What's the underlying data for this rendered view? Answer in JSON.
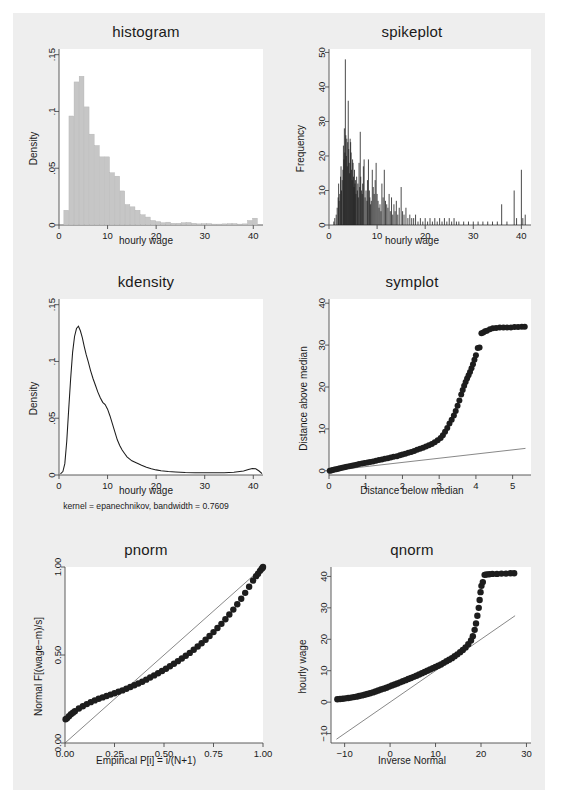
{
  "page": {
    "background": "#eeeeee",
    "outer_background": "#ffffff",
    "layout": "2 columns x 3 rows of Stata distribution diagnostic plots"
  },
  "panels": [
    {
      "id": "histogram",
      "title": "histogram"
    },
    {
      "id": "spikeplot",
      "title": "spikeplot"
    },
    {
      "id": "kdensity",
      "title": "kdensity"
    },
    {
      "id": "symplot",
      "title": "symplot"
    },
    {
      "id": "pnorm",
      "title": "pnorm"
    },
    {
      "id": "qnorm",
      "title": "qnorm"
    }
  ],
  "chart_data": [
    {
      "type": "bar",
      "id": "histogram",
      "title": "histogram",
      "xlabel": "hourly wage",
      "ylabel": "Density",
      "xlim": [
        0,
        42
      ],
      "ylim": [
        0,
        0.155
      ],
      "xticks": [
        0,
        10,
        20,
        30,
        40
      ],
      "xticklabels": [
        "0",
        "10",
        "20",
        "30",
        "40"
      ],
      "yticks": [
        0,
        0.05,
        0.1,
        0.15
      ],
      "yticklabels": [
        "0",
        ".05",
        ".1",
        ".15"
      ],
      "grid": false,
      "bin_width": 1.05,
      "bin_starts": [
        1.0,
        2.05,
        3.1,
        4.15,
        5.2,
        6.25,
        7.3,
        8.35,
        9.4,
        10.45,
        11.5,
        12.55,
        13.6,
        14.65,
        15.7,
        16.75,
        17.8,
        18.85,
        19.9,
        20.95,
        22.0,
        23.05,
        24.1,
        25.15,
        26.2,
        27.25,
        28.3,
        29.35,
        30.4,
        31.45,
        32.5,
        33.55,
        34.6,
        35.65,
        36.7,
        37.75,
        38.8,
        39.85
      ],
      "values": [
        0.013,
        0.096,
        0.126,
        0.131,
        0.104,
        0.08,
        0.07,
        0.06,
        0.06,
        0.046,
        0.043,
        0.03,
        0.018,
        0.016,
        0.013,
        0.009,
        0.007,
        0.004,
        0.003,
        0.002,
        0.0025,
        0.0015,
        0.0015,
        0.002,
        0.0022,
        0.0015,
        0.001,
        0.0012,
        0.0012,
        0.0008,
        0.0008,
        0.001,
        0.0012,
        0.0012,
        0.0008,
        0.001,
        0.004,
        0.006
      ]
    },
    {
      "type": "bar",
      "id": "spikeplot",
      "title": "spikeplot",
      "xlabel": "hourly wage",
      "ylabel": "Frequency",
      "xlim": [
        0,
        42
      ],
      "ylim": [
        0,
        51
      ],
      "xticks": [
        0,
        10,
        20,
        30,
        40
      ],
      "xticklabels": [
        "0",
        "10",
        "20",
        "30",
        "40"
      ],
      "yticks": [
        0,
        10,
        20,
        30,
        40,
        50
      ],
      "yticklabels": [
        "0",
        "10",
        "20",
        "30",
        "40",
        "50"
      ],
      "grid": false,
      "style": "thin vertical spikes at each distinct wage value",
      "x": [
        1.0,
        1.2,
        1.5,
        1.7,
        1.9,
        2.0,
        2.1,
        2.25,
        2.4,
        2.5,
        2.6,
        2.75,
        2.9,
        3.0,
        3.1,
        3.2,
        3.3,
        3.4,
        3.5,
        3.6,
        3.7,
        3.8,
        3.9,
        4.0,
        4.1,
        4.2,
        4.3,
        4.4,
        4.5,
        4.6,
        4.7,
        4.8,
        4.9,
        5.0,
        5.1,
        5.2,
        5.3,
        5.4,
        5.5,
        5.6,
        5.75,
        5.9,
        6.0,
        6.1,
        6.25,
        6.4,
        6.5,
        6.6,
        6.75,
        6.9,
        7.0,
        7.15,
        7.3,
        7.5,
        7.7,
        7.9,
        8.0,
        8.2,
        8.4,
        8.5,
        8.65,
        8.8,
        9.0,
        9.2,
        9.4,
        9.6,
        9.8,
        10.0,
        10.2,
        10.4,
        10.6,
        10.8,
        11.0,
        11.25,
        11.5,
        11.75,
        12.0,
        12.25,
        12.5,
        12.75,
        13.0,
        13.25,
        13.5,
        13.75,
        14.0,
        14.3,
        14.6,
        15.0,
        15.3,
        15.6,
        16.0,
        16.4,
        16.8,
        17.2,
        17.6,
        18.0,
        18.5,
        19.0,
        19.5,
        20.0,
        20.5,
        21.0,
        21.5,
        22.0,
        22.5,
        23.0,
        23.5,
        24.0,
        24.5,
        25.0,
        25.5,
        26.0,
        26.5,
        27.0,
        28.0,
        29.0,
        30.0,
        31.0,
        32.0,
        33.0,
        34.0,
        35.0,
        35.9,
        37.0,
        38.5,
        39.0,
        40.0,
        40.3,
        40.8
      ],
      "values": [
        1,
        2,
        3,
        5,
        8,
        12,
        7,
        9,
        14,
        17,
        10,
        13,
        16,
        23,
        19,
        28,
        21,
        48,
        26,
        20,
        25,
        17,
        24,
        36,
        22,
        18,
        15,
        25,
        24,
        21,
        16,
        13,
        19,
        18,
        14,
        11,
        16,
        12,
        13,
        9,
        14,
        10,
        12,
        8,
        18,
        11,
        27,
        14,
        10,
        9,
        12,
        17,
        19,
        8,
        10,
        7,
        13,
        19,
        10,
        8,
        6,
        7,
        16,
        11,
        9,
        13,
        18,
        9,
        7,
        5,
        6,
        4,
        12,
        8,
        16,
        7,
        6,
        5,
        9,
        4,
        8,
        3,
        6,
        4,
        7,
        3,
        5,
        11,
        4,
        3,
        5,
        2,
        3,
        2,
        2,
        3,
        1,
        2,
        1,
        2,
        1,
        2,
        1,
        2,
        1,
        2,
        1,
        2,
        1,
        2,
        1,
        2,
        1,
        1,
        1,
        1,
        1,
        1,
        1,
        1,
        1,
        1,
        6,
        1,
        10,
        2,
        16,
        2,
        3
      ]
    },
    {
      "type": "line",
      "id": "kdensity",
      "title": "kdensity",
      "xlabel": "hourly wage",
      "ylabel": "Density",
      "note": "kernel = epanechnikov, bandwidth = 0.7609",
      "xlim": [
        0,
        42
      ],
      "ylim": [
        0,
        0.155
      ],
      "xticks": [
        0,
        10,
        20,
        30,
        40
      ],
      "xticklabels": [
        "0",
        "10",
        "20",
        "30",
        "40"
      ],
      "yticks": [
        0,
        0.05,
        0.1,
        0.15
      ],
      "yticklabels": [
        "0",
        ".05",
        ".1",
        ".15"
      ],
      "grid": false,
      "x": [
        0.3,
        0.8,
        1.2,
        1.6,
        2.0,
        2.4,
        2.8,
        3.2,
        3.6,
        4.0,
        4.4,
        4.8,
        5.2,
        5.6,
        6.0,
        6.5,
        7.0,
        7.5,
        8.0,
        8.5,
        9.0,
        9.5,
        10.0,
        10.5,
        11.0,
        11.5,
        12.0,
        12.5,
        13.0,
        13.5,
        14.0,
        15.0,
        16.0,
        17.0,
        18.0,
        19.0,
        20.0,
        21.0,
        22.5,
        24.0,
        26.0,
        28.0,
        30.0,
        32.0,
        34.0,
        36.0,
        38.0,
        39.0,
        39.8,
        40.5,
        41.2,
        41.8
      ],
      "y": [
        0.001,
        0.003,
        0.01,
        0.03,
        0.058,
        0.085,
        0.108,
        0.122,
        0.129,
        0.131,
        0.127,
        0.121,
        0.113,
        0.106,
        0.1,
        0.092,
        0.085,
        0.079,
        0.073,
        0.068,
        0.064,
        0.062,
        0.058,
        0.052,
        0.045,
        0.038,
        0.031,
        0.026,
        0.022,
        0.019,
        0.016,
        0.0125,
        0.0105,
        0.0085,
        0.0068,
        0.0055,
        0.0045,
        0.0038,
        0.003,
        0.0026,
        0.0022,
        0.002,
        0.0019,
        0.0019,
        0.002,
        0.0024,
        0.0035,
        0.0048,
        0.0058,
        0.0055,
        0.0035,
        0.0012
      ]
    },
    {
      "type": "scatter",
      "id": "symplot",
      "title": "symplot",
      "xlabel": "Distance below median",
      "ylabel": "Distance above median",
      "xlim": [
        0,
        5.5
      ],
      "ylim": [
        -1,
        41
      ],
      "xticks": [
        0,
        1,
        2,
        3,
        4,
        5
      ],
      "xticklabels": [
        "0",
        "1",
        "2",
        "3",
        "4",
        "5"
      ],
      "yticks": [
        0,
        10,
        20,
        30,
        40
      ],
      "yticklabels": [
        "0",
        "10",
        "20",
        "30",
        "40"
      ],
      "grid": false,
      "reference_line": {
        "type": "identity",
        "from": [
          0,
          0
        ],
        "to": [
          5.35,
          5.35
        ]
      },
      "x": [
        0.02,
        0.06,
        0.1,
        0.15,
        0.2,
        0.25,
        0.3,
        0.36,
        0.42,
        0.48,
        0.55,
        0.62,
        0.68,
        0.75,
        0.82,
        0.9,
        0.97,
        1.05,
        1.12,
        1.2,
        1.28,
        1.36,
        1.44,
        1.52,
        1.6,
        1.68,
        1.76,
        1.85,
        1.93,
        2.0,
        2.08,
        2.16,
        2.24,
        2.32,
        2.4,
        2.48,
        2.56,
        2.64,
        2.72,
        2.8,
        2.88,
        2.96,
        3.04,
        3.1,
        3.16,
        3.22,
        3.28,
        3.34,
        3.4,
        3.45,
        3.5,
        3.55,
        3.6,
        3.64,
        3.68,
        3.72,
        3.76,
        3.8,
        3.84,
        3.88,
        3.92,
        3.96,
        4.0,
        4.05,
        4.1,
        4.15,
        4.2,
        4.25,
        4.3,
        4.38,
        4.46,
        4.55,
        4.65,
        4.75,
        4.85,
        4.95,
        5.05,
        5.15,
        5.25,
        5.33
      ],
      "y": [
        0.0,
        0.1,
        0.2,
        0.3,
        0.4,
        0.5,
        0.62,
        0.74,
        0.86,
        0.98,
        1.1,
        1.22,
        1.34,
        1.46,
        1.6,
        1.72,
        1.85,
        1.98,
        2.1,
        2.25,
        2.4,
        2.55,
        2.7,
        2.85,
        3.0,
        3.18,
        3.35,
        3.5,
        3.7,
        3.9,
        4.1,
        4.3,
        4.5,
        4.75,
        5.0,
        5.25,
        5.5,
        5.8,
        6.1,
        6.4,
        6.8,
        7.3,
        7.8,
        8.5,
        9.3,
        10.2,
        11.3,
        12.2,
        13.2,
        14.3,
        15.5,
        16.8,
        18.2,
        19.3,
        20.3,
        21.2,
        22.0,
        22.8,
        23.6,
        24.5,
        25.4,
        26.5,
        27.6,
        29.3,
        29.4,
        32.8,
        33.0,
        33.3,
        33.4,
        33.8,
        34.0,
        34.1,
        34.2,
        34.2,
        34.2,
        34.2,
        34.3,
        34.3,
        34.4,
        34.4
      ]
    },
    {
      "type": "scatter",
      "id": "pnorm",
      "title": "pnorm",
      "xlabel": "Empirical P[i] = i/(N+1)",
      "ylabel": "Normal F[(wage−m)/s]",
      "xlim": [
        0,
        1
      ],
      "ylim": [
        0,
        1
      ],
      "xticks": [
        0,
        0.25,
        0.5,
        0.75,
        1.0
      ],
      "xticklabels": [
        "0.00",
        "0.25",
        "0.50",
        "0.75",
        "1.00"
      ],
      "yticks": [
        0,
        0.5,
        1.0
      ],
      "yticklabels": [
        "0.00",
        "0.50",
        "1.00"
      ],
      "grid": false,
      "reference_line": {
        "type": "identity",
        "from": [
          0,
          0
        ],
        "to": [
          1,
          1
        ]
      },
      "x": [
        0.003,
        0.01,
        0.02,
        0.03,
        0.04,
        0.05,
        0.07,
        0.09,
        0.11,
        0.13,
        0.15,
        0.17,
        0.19,
        0.21,
        0.23,
        0.25,
        0.27,
        0.29,
        0.31,
        0.33,
        0.35,
        0.37,
        0.39,
        0.41,
        0.43,
        0.45,
        0.47,
        0.49,
        0.51,
        0.53,
        0.55,
        0.57,
        0.59,
        0.61,
        0.63,
        0.65,
        0.67,
        0.69,
        0.71,
        0.73,
        0.75,
        0.77,
        0.79,
        0.81,
        0.83,
        0.85,
        0.87,
        0.89,
        0.91,
        0.93,
        0.95,
        0.965,
        0.975,
        0.985,
        0.992,
        0.997,
        1.0
      ],
      "y": [
        0.135,
        0.14,
        0.152,
        0.163,
        0.172,
        0.18,
        0.196,
        0.209,
        0.221,
        0.232,
        0.242,
        0.251,
        0.259,
        0.267,
        0.275,
        0.283,
        0.291,
        0.299,
        0.308,
        0.318,
        0.328,
        0.338,
        0.348,
        0.36,
        0.372,
        0.384,
        0.396,
        0.409,
        0.422,
        0.436,
        0.45,
        0.465,
        0.48,
        0.496,
        0.512,
        0.53,
        0.548,
        0.567,
        0.587,
        0.608,
        0.63,
        0.653,
        0.677,
        0.703,
        0.73,
        0.758,
        0.788,
        0.82,
        0.853,
        0.888,
        0.923,
        0.948,
        0.962,
        0.978,
        0.988,
        0.995,
        1.0
      ]
    },
    {
      "type": "scatter",
      "id": "qnorm",
      "title": "qnorm",
      "xlabel": "Inverse Normal",
      "ylabel": "hourly wage",
      "xlim": [
        -13,
        31
      ],
      "ylim": [
        -13,
        43
      ],
      "xticks": [
        -10,
        0,
        10,
        20,
        30
      ],
      "xticklabels": [
        "−10",
        "0",
        "10",
        "20",
        "30"
      ],
      "yticks": [
        -10,
        0,
        10,
        20,
        30,
        40
      ],
      "yticklabels": [
        "−10",
        "0",
        "10",
        "20",
        "30",
        "40"
      ],
      "grid": false,
      "reference_line": {
        "type": "identity",
        "from": [
          -11.8,
          -11.8
        ],
        "to": [
          27.5,
          27.5
        ]
      },
      "x": [
        -11.6,
        -11.0,
        -10.4,
        -9.8,
        -9.2,
        -8.6,
        -8.0,
        -7.4,
        -6.8,
        -6.2,
        -5.6,
        -5.0,
        -4.4,
        -3.8,
        -3.2,
        -2.6,
        -2.0,
        -1.4,
        -0.8,
        -0.2,
        0.4,
        1.0,
        1.6,
        2.2,
        2.8,
        3.4,
        4.0,
        4.6,
        5.2,
        5.8,
        6.4,
        7.0,
        7.6,
        8.2,
        8.8,
        9.4,
        10.0,
        10.6,
        11.2,
        11.8,
        12.4,
        13.0,
        13.6,
        14.2,
        14.8,
        15.4,
        16.0,
        16.6,
        17.2,
        17.8,
        18.2,
        18.6,
        18.9,
        19.2,
        19.5,
        19.7,
        19.9,
        20.1,
        20.4,
        20.8,
        21.2,
        21.8,
        22.5,
        23.5,
        24.5,
        25.5,
        26.5,
        27.3
      ],
      "y": [
        0.9,
        1.0,
        1.1,
        1.2,
        1.3,
        1.45,
        1.6,
        1.75,
        1.95,
        2.15,
        2.35,
        2.6,
        2.85,
        3.1,
        3.4,
        3.7,
        4.0,
        4.3,
        4.6,
        4.95,
        5.3,
        5.6,
        5.95,
        6.3,
        6.65,
        7.0,
        7.35,
        7.7,
        8.05,
        8.4,
        8.8,
        9.2,
        9.6,
        10.0,
        10.4,
        10.8,
        11.2,
        11.6,
        12.0,
        12.5,
        13.0,
        13.5,
        14.0,
        14.6,
        15.2,
        15.9,
        16.6,
        17.4,
        18.4,
        19.6,
        21.0,
        23.0,
        25.0,
        27.5,
        30.0,
        32.5,
        35.0,
        37.0,
        38.2,
        40.5,
        40.6,
        40.7,
        40.8,
        40.8,
        40.9,
        40.9,
        41.0,
        41.0
      ]
    }
  ]
}
